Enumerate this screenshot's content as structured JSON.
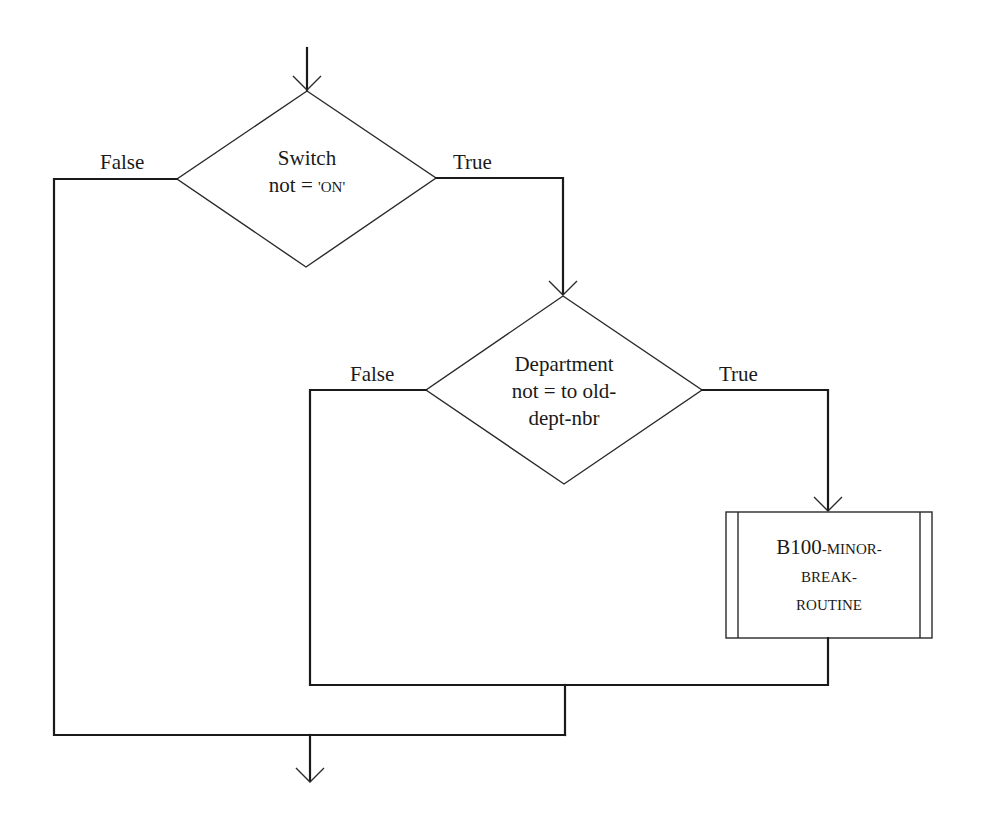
{
  "diagram": {
    "type": "flowchart",
    "decision1": {
      "line1": "Switch",
      "line2_prefix": "not = ",
      "line2_value": "'ON'",
      "false_label": "False",
      "true_label": "True"
    },
    "decision2": {
      "line1": "Department",
      "line2": "not = to old-",
      "line3": "dept-nbr",
      "false_label": "False",
      "true_label": "True"
    },
    "process": {
      "line1_prefix": "B100",
      "line1_rest": "-MINOR-",
      "line2": "BREAK-",
      "line3": "ROUTINE"
    },
    "colors": {
      "stroke": "#1a1a1a",
      "background": "#ffffff"
    }
  }
}
